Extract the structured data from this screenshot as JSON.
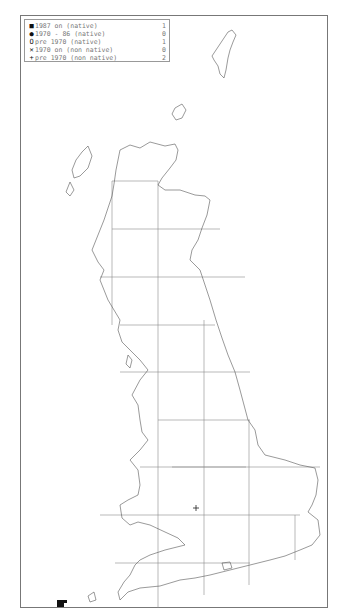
{
  "legend": {
    "rows": [
      {
        "symbol": "filled-square",
        "glyph": "■",
        "label": "1987 on (native)",
        "count": "1"
      },
      {
        "symbol": "filled-circle",
        "glyph": "●",
        "label": "1970 - 86 (native)",
        "count": "0"
      },
      {
        "symbol": "open-circle",
        "glyph": "O",
        "label": "pre 1970 (native)",
        "count": "1"
      },
      {
        "symbol": "cross-x",
        "glyph": "✕",
        "label": "1970 on (non native)",
        "count": "0"
      },
      {
        "symbol": "plus",
        "glyph": "+",
        "label": "pre 1970 (non native)",
        "count": "2"
      }
    ]
  },
  "map": {
    "region": "Great Britain",
    "grid_color": "#888888",
    "coast_color": "#555555",
    "records": [
      {
        "symbol": "plus",
        "x": 196,
        "y": 508
      },
      {
        "symbol": "filled-square",
        "x": 59,
        "y": 604
      }
    ]
  }
}
